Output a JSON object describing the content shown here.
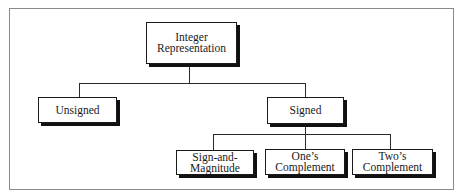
{
  "diagram": {
    "root": {
      "id": "integer-representation",
      "lines": [
        "Integer",
        "Representation"
      ]
    },
    "level1": [
      {
        "id": "unsigned",
        "lines": [
          "Unsigned"
        ]
      },
      {
        "id": "signed",
        "lines": [
          "Signed"
        ]
      }
    ],
    "level2": [
      {
        "id": "sign-and-magnitude",
        "parent": "signed",
        "lines": [
          "Sign-and-",
          "Magnitude"
        ]
      },
      {
        "id": "ones-complement",
        "parent": "signed",
        "lines": [
          "One’s",
          "Complement"
        ]
      },
      {
        "id": "twos-complement",
        "parent": "signed",
        "lines": [
          "Two’s",
          "Complement"
        ]
      }
    ],
    "edges": [
      [
        "integer-representation",
        "unsigned"
      ],
      [
        "integer-representation",
        "signed"
      ],
      [
        "signed",
        "sign-and-magnitude"
      ],
      [
        "signed",
        "ones-complement"
      ],
      [
        "signed",
        "twos-complement"
      ]
    ]
  }
}
